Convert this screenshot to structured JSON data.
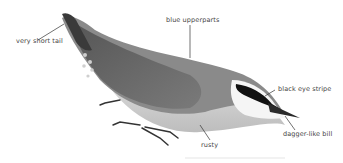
{
  "illustration": {
    "subject": "nuthatch",
    "labels": {
      "tail": "very short tail",
      "upperparts": "blue upperparts",
      "eye_stripe": "black eye stripe",
      "bill": "dagger-like bill",
      "underparts": "rusty"
    }
  }
}
